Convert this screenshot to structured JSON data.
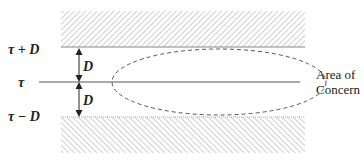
{
  "diagram": {
    "labels": {
      "upper_bound": "τ + D",
      "threshold": "τ",
      "lower_bound": "τ − D",
      "upper_distance": "D",
      "lower_distance": "D",
      "area_line1": "Area of",
      "area_line2": "Concern"
    },
    "colors": {
      "hatch": "#b8b8b8",
      "line": "#555555",
      "dashed": "#555555",
      "text": "#222222"
    }
  }
}
